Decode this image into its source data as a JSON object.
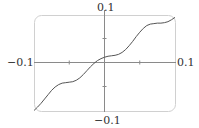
{
  "chart_data": {
    "type": "line",
    "title": "",
    "xlabel": "",
    "ylabel": "",
    "xlim": [
      -0.1,
      0.1
    ],
    "ylim": [
      -0.1,
      0.1
    ],
    "grid": false,
    "legend": null,
    "x_ticks": [
      -0.05,
      0.05
    ],
    "y_ticks": [
      -0.05,
      0.05
    ],
    "axis_labels": {
      "top": "0.1",
      "bottom": "−0.1",
      "left": "−0.1",
      "right": "0.1"
    },
    "series": [
      {
        "name": "f(x)",
        "x": [
          -0.1,
          -0.095,
          -0.09,
          -0.085,
          -0.08,
          -0.075,
          -0.07,
          -0.065,
          -0.06,
          -0.055,
          -0.05,
          -0.045,
          -0.04,
          -0.035,
          -0.03,
          -0.025,
          -0.02,
          -0.015,
          -0.01,
          -0.005,
          0.0,
          0.005,
          0.01,
          0.015,
          0.02,
          0.025,
          0.03,
          0.035,
          0.04,
          0.045,
          0.05,
          0.055,
          0.06,
          0.065,
          0.07,
          0.075,
          0.08,
          0.085,
          0.09,
          0.095,
          0.1
        ],
        "y": [
          -0.1,
          -0.093,
          -0.085,
          -0.076,
          -0.067,
          -0.058,
          -0.051,
          -0.046,
          -0.043,
          -0.042,
          -0.041,
          -0.04,
          -0.037,
          -0.032,
          -0.025,
          -0.017,
          -0.009,
          -0.002,
          0.004,
          0.008,
          0.011,
          0.013,
          0.014,
          0.015,
          0.017,
          0.021,
          0.027,
          0.035,
          0.044,
          0.054,
          0.063,
          0.071,
          0.077,
          0.08,
          0.081,
          0.082,
          0.082,
          0.083,
          0.085,
          0.089,
          0.094
        ]
      }
    ],
    "colors": {
      "curve": "#555555",
      "axes": "#888888",
      "frame": "#cccccc"
    }
  }
}
